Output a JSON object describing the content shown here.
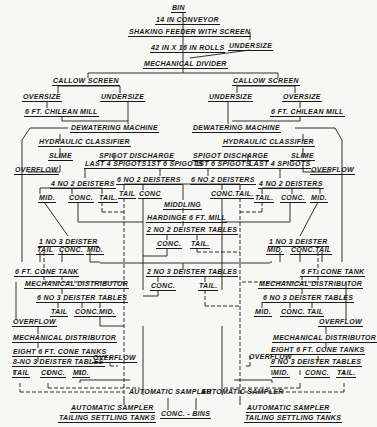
{
  "nodes": {
    "bin": "Bin",
    "conveyor": "14 in Conveyor",
    "shaking_feeder": "Shaking Feeder with Screen",
    "rolls": "42 in x 16 in Rolls",
    "undersize_top": "Undersize",
    "mech_divider": "Mechanical Divider",
    "left": {
      "callow": "Callow Screen",
      "oversize": "Oversize",
      "undersize": "Undersize",
      "chilean": "6 ft. Chilean Mill",
      "dewatering": "Dewatering Machine",
      "hydraulic": "Hydraulic Classifier",
      "slime": "Slime",
      "spigot": "Spigot Discharge",
      "last4": "Last 4 Spigots",
      "first6": "1st 6 Spigots",
      "overflow": "Overflow",
      "deisters4": "4 No 2 Deisters",
      "d4_mid": "Mid.",
      "d4_conc": "Conc.",
      "d4_tail": "Tail.",
      "deister3": "1 No 3 Deister",
      "d3_tail": "Tail",
      "d3_conc": "Conc.",
      "d3_mid": "Mid.",
      "cone_tank": "6 ft. Cone Tank",
      "mech_dist": "Mechanical Distributor",
      "tables6": "6 No 3 Deister Tables",
      "t6_tail": "Tail",
      "t6_conc": "Conc.",
      "t6_mid": "Mid.",
      "overflow2": "Overflow",
      "mech_dist2": "Mechanical Distributor",
      "eight_cone": "Eight 6 ft. Cone Tanks",
      "tables8": "8-No 3 Deister Tables",
      "overflow3": "Overflow",
      "t8_tail": "Tail",
      "t8_conc": "Conc.",
      "t8_mid": "Mid.",
      "auto_sampler": "Automatic Sampler",
      "auto_sampler2": "Automatic Sampler",
      "tailing_tanks": "Tailing Settling Tanks"
    },
    "right": {
      "callow": "Callow Screen",
      "undersize": "Undersize",
      "oversize": "Oversize",
      "chilean": "6 ft. Chilean Mill",
      "dewatering": "Dewatering Machine",
      "hydraulic": "Hydraulic Classifier",
      "spigot": "Spigot Discharge",
      "slime": "Slime",
      "first6": "1st 6 Spigots",
      "last4": "Last 4 Spigots",
      "overflow": "Overflow",
      "deisters4": "4 No 2 Deisters",
      "d4_tail": "Tail.",
      "d4_conc": "Conc.",
      "d4_mid": "Mid.",
      "deister3": "1 No 3 Deister",
      "d3_mid": "Mid.",
      "d3_conc": "Conc.",
      "d3_tail": "Tail",
      "cone_tank": "6 ft. Cone Tank",
      "mech_dist": "Mechanical Distributor",
      "tables6": "6 No 3 Deister Tables",
      "t6_mid": "Mid.",
      "t6_conc": "Conc.",
      "t6_tail": "Tail",
      "overflow2": "Overflow",
      "mech_dist2": "Mechanical Distributor",
      "eight_cone": "Eight 6 ft. Cone Tanks",
      "overflow3": "Overflow",
      "tables8": "8 No 3 Deister Tables",
      "t8_mid": "Mid.",
      "t8_conc": "Conc.",
      "t8_tail": "Tail.",
      "auto_sampler": "Automatic Sampler",
      "auto_sampler2": "Automatic Sampler",
      "tailing_tanks": "Tailing Settling Tanks"
    },
    "center": {
      "deisters6_l": "6 No 2 Deisters",
      "l_tail": "Tail",
      "l_conc": "Conc",
      "deisters6_r": "6 No 2 Deisters",
      "r_conc": "Conc.",
      "r_tail": "Tail.",
      "middling": "Middling",
      "harding": "Hardinge 6 ft. Mill",
      "tables2": "2 No 2 Deister Tables",
      "t2_conc": "Conc.",
      "t2_tail": "Tail.",
      "tables2b": "2 No 3 Deister Tables",
      "t2b_conc": "Conc.",
      "t2b_tail": "Tail.",
      "conc_bins": "Conc. - Bins"
    }
  }
}
